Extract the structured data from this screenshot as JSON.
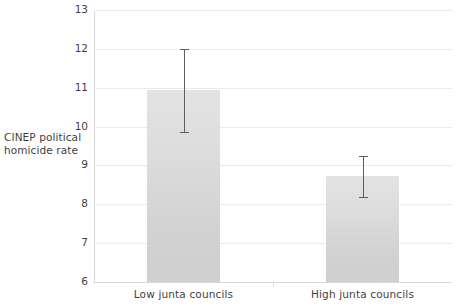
{
  "chart_data": {
    "type": "bar",
    "title": "",
    "xlabel": "",
    "ylabel": "CINEP political homicide rate",
    "ylabel_lines": [
      "CINEP political",
      "homicide rate"
    ],
    "categories": [
      "Low junta councils",
      "High junta councils"
    ],
    "values": [
      10.95,
      8.72
    ],
    "error_bars": [
      {
        "lower": 9.87,
        "upper": 12.0
      },
      {
        "lower": 8.18,
        "upper": 9.25
      }
    ],
    "ylim": [
      6,
      13
    ],
    "yticks": [
      13,
      12,
      11,
      10,
      9,
      8,
      7,
      6
    ],
    "ytick_labels": [
      "13",
      "12",
      "11",
      "10",
      "9",
      "8",
      "7",
      "6"
    ],
    "grid": true,
    "grid_axis": "y",
    "legend": null,
    "legend_position": "none",
    "colors": {
      "bar_fill_top": "#e3e3e3",
      "bar_fill_bottom": "#cfcfcf",
      "error_bar": "#5e5e5e",
      "gridline": "#eaeaea",
      "axis_line": "#d9d9d9",
      "text": "#3f3f3f",
      "background": "#ffffff"
    }
  }
}
